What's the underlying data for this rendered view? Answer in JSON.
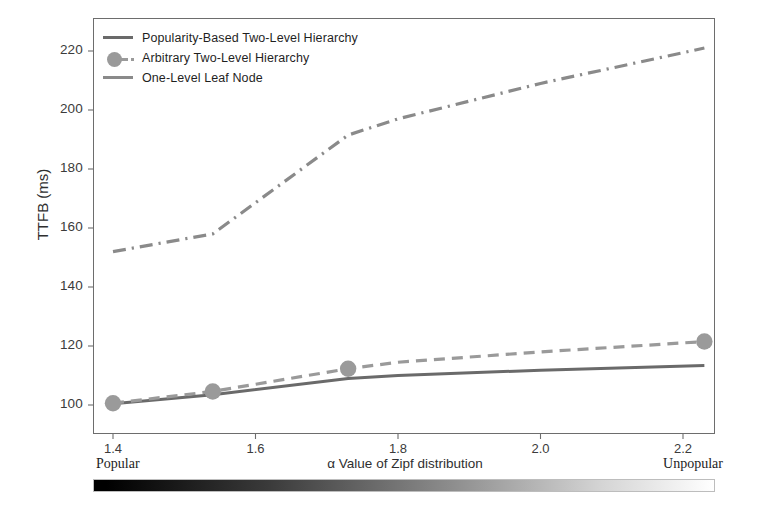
{
  "chart_data": {
    "type": "line",
    "title": "",
    "xlabel": "α Value of Zipf distribution",
    "ylabel": "TTFB (ms)",
    "xlim": [
      1.35,
      2.27
    ],
    "ylim": [
      95,
      226
    ],
    "xticks": [
      "1.4",
      "1.6",
      "1.8",
      "2.0",
      "2.2"
    ],
    "xtick_values": [
      1.4,
      1.6,
      1.8,
      2.0,
      2.2
    ],
    "yticks": [
      "100",
      "120",
      "140",
      "160",
      "180",
      "200",
      "220"
    ],
    "ytick_values": [
      100,
      120,
      140,
      160,
      180,
      200,
      220
    ],
    "grid": false,
    "legend_position": "top-left",
    "x": [
      1.4,
      1.54,
      1.73,
      1.8,
      2.0,
      2.23
    ],
    "series": [
      {
        "name": "Popularity-Based Two-Level Hierarchy",
        "style": "solid",
        "color": "#6a6a6a",
        "marker": "none",
        "values": [
          100.4,
          103.5,
          109.0,
          110.0,
          111.8,
          113.4
        ]
      },
      {
        "name": "Arbitrary Two-Level Hierarchy",
        "style": "dashed",
        "color": "#9a9a9a",
        "marker": "circle",
        "marker_x": [
          1.4,
          1.54,
          1.73,
          2.23
        ],
        "marker_values": [
          100.6,
          104.6,
          112.3,
          121.5
        ],
        "values": [
          100.6,
          104.6,
          112.3,
          114.5,
          118.0,
          121.5
        ]
      },
      {
        "name": "One-Level Leaf Node",
        "style": "dashdot",
        "color": "#8a8a8a",
        "marker": "none",
        "values": [
          152.0,
          158.0,
          191.5,
          197.0,
          209.0,
          221.0
        ]
      }
    ],
    "axis_gradient": {
      "left_label": "Popular",
      "right_label": "Unpopular",
      "from_color": "#000000",
      "to_color": "#ffffff"
    }
  },
  "legend": {
    "items": [
      {
        "label": "Popularity-Based Two-Level Hierarchy"
      },
      {
        "label": "Arbitrary Two-Level Hierarchy"
      },
      {
        "label": "One-Level Leaf Node"
      }
    ]
  },
  "axes": {
    "y_label": "TTFB (ms)",
    "x_label": "α Value of Zipf distribution",
    "y_ticks": [
      "220",
      "200",
      "180",
      "160",
      "140",
      "120",
      "100"
    ],
    "x_ticks": [
      "1.4",
      "1.6",
      "1.8",
      "2.0",
      "2.2"
    ],
    "popular_label": "Popular",
    "unpopular_label": "Unpopular"
  }
}
